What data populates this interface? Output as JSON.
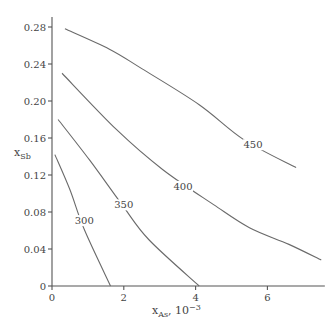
{
  "chart_data": {
    "type": "line",
    "title": "",
    "xlabel": "x_As, 10^-3",
    "xlabel_main": "x",
    "xlabel_sub": "As",
    "xlabel_suffix": ", 10",
    "xlabel_sup": "−3",
    "ylabel": "x_Sb",
    "ylabel_main": "x",
    "ylabel_sub": "Sb",
    "xlim": [
      0,
      7.6
    ],
    "ylim": [
      0,
      0.28
    ],
    "grid": false,
    "x_ticks": [
      0,
      2,
      4,
      6
    ],
    "x_tick_labels": [
      "0",
      "2",
      "4",
      "6"
    ],
    "y_ticks": [
      0,
      0.04,
      0.08,
      0.12,
      0.16,
      0.2,
      0.24,
      0.28
    ],
    "y_tick_labels": [
      "0",
      "0.04",
      "0.08",
      "0.12",
      "0.16",
      "0.20",
      "0.24",
      "0.28"
    ],
    "series": [
      {
        "name": "300",
        "label_pos": [
          0.9,
          0.068
        ],
        "x": [
          0.08,
          0.5,
          0.9,
          1.63
        ],
        "y": [
          0.142,
          0.104,
          0.061,
          0.0
        ]
      },
      {
        "name": "350",
        "label_pos": [
          2.0,
          0.085
        ],
        "x": [
          0.17,
          1.05,
          1.95,
          2.7,
          4.1
        ],
        "y": [
          0.18,
          0.136,
          0.088,
          0.05,
          0.0
        ]
      },
      {
        "name": "400",
        "label_pos": [
          3.65,
          0.105
        ],
        "x": [
          0.28,
          1.8,
          3.08,
          4.5,
          5.5,
          6.6,
          7.5
        ],
        "y": [
          0.23,
          0.169,
          0.126,
          0.088,
          0.063,
          0.045,
          0.028
        ]
      },
      {
        "name": "450",
        "label_pos": [
          5.6,
          0.15
        ],
        "x": [
          0.36,
          1.6,
          2.5,
          4.1,
          5.35,
          6.8
        ],
        "y": [
          0.278,
          0.256,
          0.235,
          0.196,
          0.158,
          0.128
        ]
      }
    ]
  }
}
